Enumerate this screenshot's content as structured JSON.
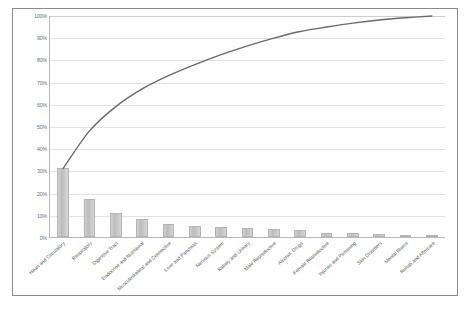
{
  "chart_data": {
    "type": "bar",
    "title": "",
    "subtitle": "",
    "xlabel": "",
    "ylabel": "",
    "ylim": [
      0,
      100
    ],
    "grid": true,
    "legend": false,
    "categories": [
      "Heart and Circulatory",
      "Respiratory",
      "Digestive Tract",
      "Endocrine and Nutritional",
      "Musculoskeletal and Connective",
      "Liver and Pancreas",
      "Nervous System",
      "Kidney and Urinary",
      "Male Reproductive",
      "Alcohol, Drugs",
      "Female Reproductive",
      "Injuries and Poisoning",
      "Skin Disorders",
      "Mental Illness",
      "Rehab and Aftercare"
    ],
    "series": [
      {
        "name": "Share",
        "type": "bar",
        "values": [
          31,
          17,
          11,
          8,
          6,
          5,
          4.5,
          4,
          3.5,
          3,
          2,
          1.8,
          1.4,
          1,
          0.8
        ]
      },
      {
        "name": "Cumulative",
        "type": "line",
        "values": [
          31,
          48,
          59,
          67,
          73,
          78,
          82.5,
          86.5,
          90,
          93,
          95,
          96.8,
          98.2,
          99.2,
          100
        ]
      }
    ],
    "ytick_labels": [
      "100%",
      "90%",
      "80%",
      "70%",
      "60%",
      "50%",
      "40%",
      "30%",
      "20%",
      "10%",
      "0%"
    ],
    "ytick_values": [
      100,
      90,
      80,
      70,
      60,
      50,
      40,
      30,
      20,
      10,
      0
    ],
    "colors": {
      "bar_fill": "#c9c9c9",
      "bar_border": "#b5b5b5",
      "line": "#6b6b6b",
      "gridline": "#e2e2e2",
      "axis": "#b9b9b9",
      "frame_border": "#8c8c8c",
      "tick_text": "#6d6d6d",
      "category_text": "#58585a",
      "background": "#ffffff"
    }
  }
}
